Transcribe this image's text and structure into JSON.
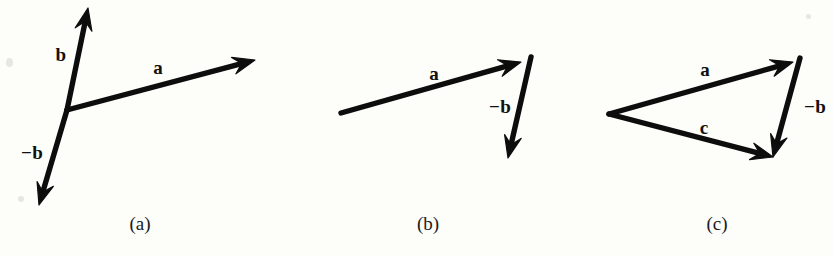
{
  "figure": {
    "width": 834,
    "height": 256,
    "background_color": "#fdfdfa",
    "ink_color": "#0d0d0d"
  },
  "panels": [
    {
      "id": "a",
      "caption": "(a)",
      "caption_pos": {
        "x": 140,
        "y": 224
      },
      "vectors": [
        {
          "name": "b",
          "label": "b",
          "label_pos": {
            "x": 61,
            "y": 55
          },
          "from": {
            "x": 67,
            "y": 110
          },
          "to": {
            "x": 88,
            "y": 8
          }
        },
        {
          "name": "a",
          "label": "a",
          "label_pos": {
            "x": 158,
            "y": 68
          },
          "from": {
            "x": 67,
            "y": 110
          },
          "to": {
            "x": 255,
            "y": 60
          }
        },
        {
          "name": "minus-b",
          "label": "−b",
          "label_pos": {
            "x": 32,
            "y": 153
          },
          "from": {
            "x": 67,
            "y": 110
          },
          "to": {
            "x": 39,
            "y": 205
          }
        }
      ]
    },
    {
      "id": "b",
      "caption": "(b)",
      "caption_pos": {
        "x": 428,
        "y": 224
      },
      "vectors": [
        {
          "name": "a",
          "label": "a",
          "label_pos": {
            "x": 434,
            "y": 74
          },
          "from": {
            "x": 341,
            "y": 113
          },
          "to": {
            "x": 521,
            "y": 62
          }
        },
        {
          "name": "minus-b",
          "label": "−b",
          "label_pos": {
            "x": 500,
            "y": 107
          },
          "from": {
            "x": 531,
            "y": 57
          },
          "to": {
            "x": 508,
            "y": 158
          }
        }
      ]
    },
    {
      "id": "c",
      "caption": "(c)",
      "caption_pos": {
        "x": 717,
        "y": 224
      },
      "vectors": [
        {
          "name": "a",
          "label": "a",
          "label_pos": {
            "x": 705,
            "y": 70
          },
          "from": {
            "x": 609,
            "y": 114
          },
          "to": {
            "x": 793,
            "y": 62
          }
        },
        {
          "name": "minus-b",
          "label": "−b",
          "label_pos": {
            "x": 815,
            "y": 107
          },
          "from": {
            "x": 800,
            "y": 58
          },
          "to": {
            "x": 773,
            "y": 157
          }
        },
        {
          "name": "c",
          "label": "c",
          "label_pos": {
            "x": 704,
            "y": 128
          },
          "from": {
            "x": 609,
            "y": 114
          },
          "to": {
            "x": 773,
            "y": 157
          }
        }
      ]
    }
  ]
}
